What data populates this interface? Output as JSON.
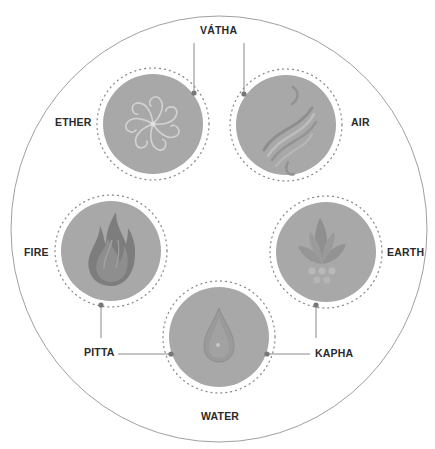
{
  "diagram": {
    "colors": {
      "background": "#ffffff",
      "outer_ring": "#9a9a9a",
      "element_fill": "#a8a8a8",
      "dotted_ring": "#8c8c8c",
      "connector": "#8a8a8a",
      "connector_dot": "#777777",
      "label": "#2a2a2a"
    },
    "doshas": [
      {
        "name": "VÁTHA",
        "elements": [
          "ETHER",
          "AIR"
        ]
      },
      {
        "name": "PITTA",
        "elements": [
          "FIRE",
          "WATER"
        ]
      },
      {
        "name": "KAPHA",
        "elements": [
          "WATER",
          "EARTH"
        ]
      }
    ],
    "elements": [
      {
        "name": "ETHER",
        "icon": "spiral-flower-icon"
      },
      {
        "name": "AIR",
        "icon": "wind-swirl-icon"
      },
      {
        "name": "FIRE",
        "icon": "flame-icon"
      },
      {
        "name": "EARTH",
        "icon": "leaf-plant-icon"
      },
      {
        "name": "WATER",
        "icon": "water-drop-icon"
      }
    ]
  }
}
